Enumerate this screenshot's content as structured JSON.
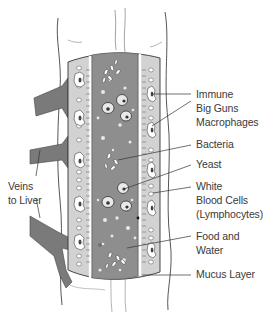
{
  "diagram": {
    "type": "illustration",
    "colors": {
      "lumen": "#8e8e8e",
      "wall": "#d2d2d2",
      "tube": "#ffffff",
      "veins": "#7a7a7a",
      "outline": "#333333"
    },
    "labels": {
      "immune": "Immune",
      "big_guns": "Big Guns",
      "macrophages": "Macrophages",
      "bacteria": "Bacteria",
      "yeast": "Yeast",
      "white": "White",
      "blood_cells": "Blood Cells",
      "lymphocytes": "(Lymphocytes)",
      "food_and": "Food and",
      "water": "Water",
      "mucus_layer": "Mucus Layer",
      "veins": "Veins",
      "to_liver": "to Liver"
    }
  }
}
